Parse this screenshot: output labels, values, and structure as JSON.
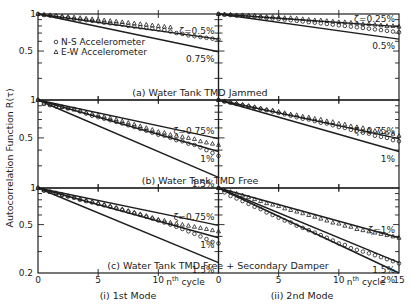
{
  "chart_data": {
    "type": "line",
    "title": "",
    "ylabel": "Autocorrelation Function R(τ)",
    "xlabel": "nth cycle",
    "y_scale": "log",
    "ylim": [
      0.2,
      1
    ],
    "xlim": [
      0,
      15
    ],
    "yticks": [
      "1",
      "0.5",
      "0.2"
    ],
    "xticks": [
      0,
      5,
      10,
      15
    ],
    "columns": [
      {
        "label": "(i) 1st Mode"
      },
      {
        "label": "(ii) 2nd Mode"
      }
    ],
    "rows": [
      {
        "label": "(a) Water Tank TMD Jammed"
      },
      {
        "label": "(b) Water Tank TMD Free"
      },
      {
        "label": "(c) Water Tank TMD Free + Secondary Damper"
      }
    ],
    "legend": [
      {
        "marker": "circle",
        "label": "N-S Accelerometer"
      },
      {
        "marker": "triangle",
        "label": "E-W Accelerometer"
      }
    ],
    "panels": [
      {
        "row": 0,
        "col": 0,
        "reference_lines": [
          {
            "zeta_label": "ζ=0.5%",
            "zeta": 0.005
          },
          {
            "zeta_label": "0.75%",
            "zeta": 0.0075
          }
        ],
        "series": [
          {
            "name": "N-S Accelerometer",
            "marker": "circle",
            "x": [
              0,
              0.5,
              1,
              1.5,
              2,
              2.5,
              3,
              3.5,
              4,
              4.5,
              5,
              5.5,
              6,
              6.5,
              7,
              7.5,
              8,
              8.5,
              9,
              9.5,
              10,
              10.5,
              11,
              11.5,
              12,
              12.5,
              13,
              13.5,
              14,
              14.5,
              15
            ],
            "y": [
              1.0,
              0.98,
              0.97,
              0.96,
              0.94,
              0.93,
              0.91,
              0.9,
              0.89,
              0.88,
              0.87,
              0.85,
              0.84,
              0.83,
              0.82,
              0.8,
              0.79,
              0.78,
              0.77,
              0.76,
              0.75,
              0.74,
              0.72,
              0.7,
              0.69,
              0.67,
              0.66,
              0.65,
              0.64,
              0.63,
              0.62
            ]
          },
          {
            "name": "E-W Accelerometer",
            "marker": "triangle",
            "x": [
              0,
              0.5,
              1,
              1.5,
              2,
              2.5,
              3,
              3.5,
              4,
              4.5,
              5,
              5.5,
              6,
              6.5,
              7,
              7.5,
              8,
              8.5,
              9,
              9.5,
              10,
              10.5,
              11
            ],
            "y": [
              1.0,
              0.99,
              0.98,
              0.97,
              0.96,
              0.95,
              0.94,
              0.93,
              0.92,
              0.91,
              0.9,
              0.89,
              0.88,
              0.87,
              0.86,
              0.85,
              0.84,
              0.83,
              0.82,
              0.81,
              0.8,
              0.79,
              0.78
            ]
          }
        ]
      },
      {
        "row": 0,
        "col": 1,
        "reference_lines": [
          {
            "zeta_label": "ζ=0.25%",
            "zeta": 0.0025
          },
          {
            "zeta_label": "0.5%",
            "zeta": 0.005
          }
        ],
        "series": [
          {
            "name": "N-S Accelerometer",
            "marker": "circle",
            "x": [
              0,
              0.5,
              1,
              1.5,
              2,
              2.5,
              3,
              3.5,
              4,
              4.5,
              5,
              5.5,
              6,
              6.5,
              7,
              7.5,
              8,
              8.5,
              9,
              9.5,
              10,
              10.5,
              11,
              11.5,
              12,
              12.5,
              13,
              13.5,
              14,
              14.5,
              15
            ],
            "y": [
              1.0,
              0.99,
              0.98,
              0.97,
              0.97,
              0.96,
              0.95,
              0.94,
              0.93,
              0.92,
              0.91,
              0.9,
              0.89,
              0.88,
              0.87,
              0.86,
              0.85,
              0.84,
              0.83,
              0.82,
              0.81,
              0.8,
              0.79,
              0.78,
              0.77,
              0.76,
              0.75,
              0.74,
              0.73,
              0.72,
              0.71
            ]
          },
          {
            "name": "E-W Accelerometer",
            "marker": "triangle",
            "x": [
              0,
              0.5,
              1,
              1.5,
              2,
              2.5,
              3,
              3.5,
              4,
              4.5,
              5,
              5.5,
              6,
              6.5,
              7,
              7.5,
              8,
              8.5,
              9,
              9.5,
              10,
              10.5,
              11,
              11.5,
              12,
              12.5,
              13,
              13.5,
              14,
              14.5,
              15
            ],
            "y": [
              1.0,
              0.99,
              0.99,
              0.98,
              0.98,
              0.97,
              0.97,
              0.96,
              0.95,
              0.95,
              0.94,
              0.93,
              0.93,
              0.92,
              0.91,
              0.9,
              0.89,
              0.89,
              0.88,
              0.87,
              0.86,
              0.86,
              0.85,
              0.84,
              0.83,
              0.83,
              0.82,
              0.81,
              0.8,
              0.8,
              0.79
            ]
          }
        ]
      },
      {
        "row": 1,
        "col": 0,
        "reference_lines": [
          {
            "zeta_label": "ζ=0.75%",
            "zeta": 0.0075
          },
          {
            "zeta_label": "1%",
            "zeta": 0.01
          },
          {
            "zeta_label": "1.5%",
            "zeta": 0.015
          }
        ],
        "series": [
          {
            "name": "N-S Accelerometer",
            "marker": "circle",
            "x": [
              0,
              0.5,
              1,
              1.5,
              2,
              2.5,
              3,
              3.5,
              4,
              4.5,
              5,
              5.5,
              6,
              6.5,
              7,
              7.5,
              8,
              8.5,
              9,
              9.5,
              10,
              10.5,
              11,
              11.5,
              12,
              12.5,
              13,
              13.5,
              14,
              14.5,
              15
            ],
            "y": [
              1.0,
              0.93,
              0.91,
              0.89,
              0.88,
              0.86,
              0.85,
              0.81,
              0.78,
              0.75,
              0.73,
              0.71,
              0.69,
              0.67,
              0.65,
              0.63,
              0.61,
              0.59,
              0.57,
              0.55,
              0.53,
              0.52,
              0.5,
              0.48,
              0.47,
              0.45,
              0.44,
              0.42,
              0.4,
              0.38,
              0.36
            ]
          },
          {
            "name": "E-W Accelerometer",
            "marker": "triangle",
            "x": [
              0,
              0.5,
              1,
              1.5,
              2,
              2.5,
              3,
              3.5,
              4,
              4.5,
              5,
              5.5,
              6,
              6.5,
              7,
              7.5,
              8,
              8.5,
              9,
              9.5,
              10,
              10.5,
              11,
              11.5,
              12,
              12.5,
              13,
              13.5,
              14,
              14.5,
              15
            ],
            "y": [
              1.0,
              0.94,
              0.92,
              0.9,
              0.88,
              0.86,
              0.84,
              0.82,
              0.8,
              0.78,
              0.76,
              0.74,
              0.72,
              0.7,
              0.68,
              0.66,
              0.64,
              0.62,
              0.6,
              0.58,
              0.56,
              0.55,
              0.53,
              0.52,
              0.51,
              0.5,
              0.49,
              0.47,
              0.46,
              0.45,
              0.44
            ]
          }
        ]
      },
      {
        "row": 1,
        "col": 1,
        "reference_lines": [
          {
            "zeta_label": "ζ=0.75%",
            "zeta": 0.0075
          },
          {
            "zeta_label": "1%",
            "zeta": 0.01
          }
        ],
        "series": [
          {
            "name": "N-S Accelerometer",
            "marker": "circle",
            "x": [
              0,
              0.5,
              1,
              1.5,
              2,
              2.5,
              3,
              3.5,
              4,
              4.5,
              5,
              5.5,
              6,
              6.5,
              7,
              7.5,
              8,
              8.5,
              9,
              9.5,
              10,
              10.5,
              11,
              11.5,
              12,
              12.5,
              13,
              13.5,
              14,
              14.5,
              15
            ],
            "y": [
              1.0,
              0.97,
              0.95,
              0.93,
              0.91,
              0.89,
              0.87,
              0.85,
              0.83,
              0.81,
              0.79,
              0.77,
              0.75,
              0.73,
              0.71,
              0.7,
              0.68,
              0.66,
              0.65,
              0.63,
              0.61,
              0.6,
              0.58,
              0.57,
              0.55,
              0.54,
              0.52,
              0.51,
              0.5,
              0.48,
              0.47
            ]
          },
          {
            "name": "E-W Accelerometer",
            "marker": "triangle",
            "x": [
              0,
              0.5,
              1,
              1.5,
              2,
              2.5,
              3,
              3.5,
              4,
              4.5,
              5,
              5.5,
              6,
              6.5,
              7,
              7.5,
              8,
              8.5,
              9,
              9.5,
              10,
              10.5,
              11,
              11.5,
              12,
              12.5,
              13,
              13.5,
              14,
              14.5,
              15
            ],
            "y": [
              1.0,
              0.98,
              0.96,
              0.94,
              0.92,
              0.9,
              0.88,
              0.86,
              0.84,
              0.83,
              0.81,
              0.79,
              0.77,
              0.76,
              0.74,
              0.73,
              0.71,
              0.7,
              0.68,
              0.67,
              0.65,
              0.64,
              0.62,
              0.61,
              0.6,
              0.58,
              0.57,
              0.56,
              0.55,
              0.54,
              0.52
            ]
          }
        ]
      },
      {
        "row": 2,
        "col": 0,
        "reference_lines": [
          {
            "zeta_label": "ζ=0.75%",
            "zeta": 0.0075
          },
          {
            "zeta_label": "1%",
            "zeta": 0.01
          },
          {
            "zeta_label": "1.5%",
            "zeta": 0.015
          }
        ],
        "series": [
          {
            "name": "N-S Accelerometer",
            "marker": "circle",
            "x": [
              0,
              0.5,
              1,
              1.5,
              2,
              2.5,
              3,
              3.5,
              4,
              4.5,
              5,
              5.5,
              6,
              6.5,
              7,
              7.5,
              8,
              8.5,
              9,
              9.5,
              10,
              10.5,
              11,
              11.5,
              12,
              12.5,
              13,
              13.5,
              14,
              14.5,
              15
            ],
            "y": [
              1.0,
              0.95,
              0.93,
              0.9,
              0.88,
              0.85,
              0.83,
              0.8,
              0.78,
              0.76,
              0.74,
              0.72,
              0.7,
              0.68,
              0.66,
              0.64,
              0.62,
              0.6,
              0.58,
              0.56,
              0.54,
              0.52,
              0.5,
              0.48,
              0.46,
              0.44,
              0.42,
              0.4,
              0.38,
              0.36,
              0.35
            ]
          },
          {
            "name": "E-W Accelerometer",
            "marker": "triangle",
            "x": [
              0,
              0.5,
              1,
              1.5,
              2,
              2.5,
              3,
              3.5,
              4,
              4.5,
              5,
              5.5,
              6,
              6.5,
              7,
              7.5,
              8,
              8.5,
              9,
              9.5,
              10,
              10.5,
              11,
              11.5,
              12,
              12.5,
              13,
              13.5,
              14,
              14.5,
              15
            ],
            "y": [
              1.0,
              0.96,
              0.93,
              0.91,
              0.88,
              0.86,
              0.84,
              0.81,
              0.79,
              0.77,
              0.75,
              0.73,
              0.71,
              0.69,
              0.67,
              0.65,
              0.63,
              0.61,
              0.59,
              0.57,
              0.55,
              0.54,
              0.52,
              0.51,
              0.5,
              0.49,
              0.48,
              0.47,
              0.46,
              0.45,
              0.44
            ]
          }
        ]
      },
      {
        "row": 2,
        "col": 1,
        "reference_lines": [
          {
            "zeta_label": "ζ=1%",
            "zeta": 0.01
          },
          {
            "zeta_label": "1.5%",
            "zeta": 0.015
          },
          {
            "zeta_label": "2%",
            "zeta": 0.02
          }
        ],
        "series": [
          {
            "name": "N-S Accelerometer",
            "marker": "circle",
            "x": [
              0,
              0.5,
              1,
              1.5,
              2,
              2.5,
              3,
              3.5,
              4,
              4.5,
              5,
              5.5,
              6,
              6.5,
              7,
              7.5,
              8,
              8.5,
              9,
              9.5,
              10,
              10.5,
              11,
              11.5,
              12,
              12.5,
              13,
              13.5,
              14,
              14.5,
              15
            ],
            "y": [
              1.0,
              0.92,
              0.86,
              0.82,
              0.78,
              0.74,
              0.7,
              0.67,
              0.63,
              0.6,
              0.57,
              0.54,
              0.52,
              0.49,
              0.47,
              0.45,
              0.43,
              0.41,
              0.39,
              0.37,
              0.35,
              0.34,
              0.32,
              0.31,
              0.3,
              0.29,
              0.28,
              0.27,
              0.26,
              0.25,
              0.24
            ]
          },
          {
            "name": "E-W Accelerometer",
            "marker": "triangle",
            "x": [
              0,
              0.5,
              1,
              1.5,
              2,
              2.5,
              3,
              3.5,
              4,
              4.5,
              5,
              5.5,
              6,
              6.5,
              7,
              7.5,
              8,
              8.5,
              9,
              9.5,
              10,
              10.5,
              11,
              11.5,
              12,
              12.5,
              13,
              13.5,
              14,
              14.5,
              15
            ],
            "y": [
              1.0,
              0.96,
              0.93,
              0.9,
              0.87,
              0.84,
              0.81,
              0.78,
              0.75,
              0.73,
              0.71,
              0.68,
              0.66,
              0.64,
              0.62,
              0.6,
              0.58,
              0.56,
              0.54,
              0.52,
              0.51,
              0.49,
              0.48,
              0.46,
              0.45,
              0.44,
              0.43,
              0.42,
              0.41,
              0.4,
              0.39
            ]
          }
        ]
      }
    ]
  },
  "labels": {
    "ylabel": "Autocorrelation Function R(τ)",
    "ytick_1": "1",
    "ytick_05": "0.5",
    "ytick_02": "0.2",
    "xcycle_n": "n",
    "xcycle_sup": "th",
    "xcycle_word": "cycle"
  }
}
